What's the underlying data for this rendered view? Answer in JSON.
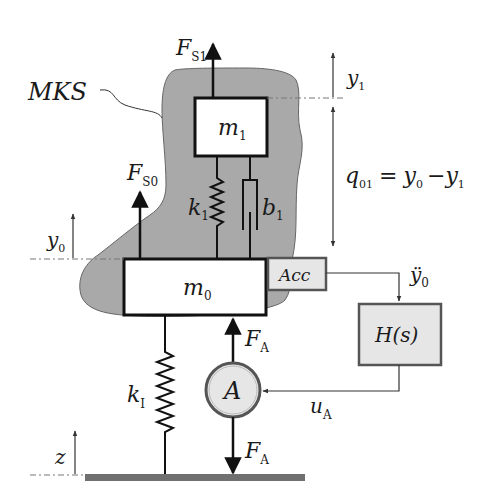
{
  "diagram": {
    "type": "mass-spring-damper system with active control",
    "colors": {
      "mks_region": "#a9a9a9",
      "box_fill": "#ffffff",
      "sensor_fill": "#e6e6e6",
      "ground": "#707070",
      "stroke": "#111111"
    },
    "region_label": "MKS",
    "masses": [
      {
        "symbol": "m",
        "subscript": "1"
      },
      {
        "symbol": "m",
        "subscript": "0"
      }
    ],
    "elements": {
      "spring_upper": {
        "symbol": "k",
        "subscript": "1"
      },
      "damper_upper": {
        "symbol": "b",
        "subscript": "1"
      },
      "spring_lower": {
        "symbol": "k",
        "subscript": "I"
      },
      "actuator": {
        "symbol": "A"
      },
      "sensor": {
        "label": "Acc"
      },
      "controller": {
        "label": "H(s)"
      }
    },
    "forces": {
      "fs1": {
        "symbol": "F",
        "subscript": "S1"
      },
      "fs0": {
        "symbol": "F",
        "subscript": "S0"
      },
      "fa_up": {
        "symbol": "F",
        "subscript": "A"
      },
      "fa_down": {
        "symbol": "F",
        "subscript": "A"
      }
    },
    "signals": {
      "acc_out": {
        "symbol": "ÿ",
        "subscript": "0"
      },
      "control": {
        "symbol": "u",
        "subscript": "A"
      }
    },
    "coordinates": {
      "y1": {
        "symbol": "y",
        "subscript": "1"
      },
      "y0": {
        "symbol": "y",
        "subscript": "0"
      },
      "z": {
        "symbol": "z"
      }
    },
    "equation": {
      "lhs": "q",
      "lhs_sub": "01",
      "eq": "=",
      "t1": "y",
      "t1_sub": "0",
      "minus": "−",
      "t2": "y",
      "t2_sub": "1"
    }
  }
}
